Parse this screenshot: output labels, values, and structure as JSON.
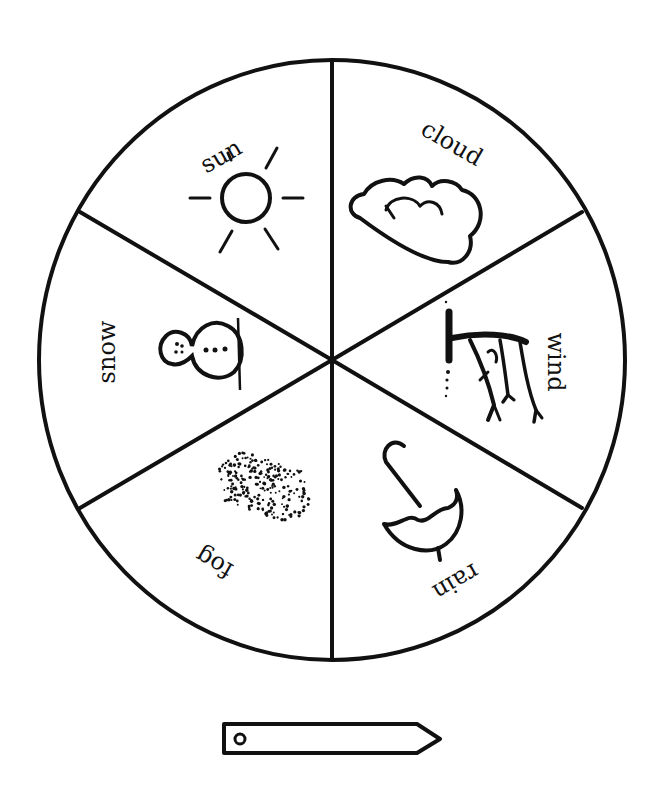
{
  "colors": {
    "ink": "#111111",
    "paper": "#ffffff"
  },
  "wheel": {
    "center": [
      332,
      360
    ],
    "rx": 293,
    "ry": 300,
    "segments": [
      {
        "id": "sun",
        "label": "sun",
        "icon": "sun-icon"
      },
      {
        "id": "cloud",
        "label": "cloud",
        "icon": "cloud-icon"
      },
      {
        "id": "wind",
        "label": "wind",
        "icon": "wind-tree-icon"
      },
      {
        "id": "rain",
        "label": "rain",
        "icon": "umbrella-icon"
      },
      {
        "id": "fog",
        "label": "fog",
        "icon": "fog-dots-icon"
      },
      {
        "id": "snow",
        "label": "snow",
        "icon": "snowman-icon"
      }
    ]
  },
  "pointer": {
    "label": "",
    "icon": "arrow-pointer-icon"
  }
}
